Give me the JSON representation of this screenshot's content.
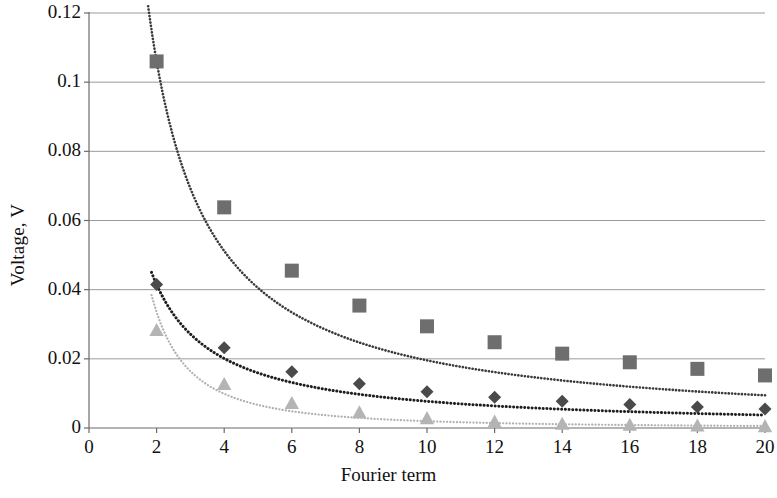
{
  "chart_data": {
    "type": "scatter",
    "title": "",
    "subtitle": "",
    "xlabel": "Fourier term",
    "ylabel": "Voltage, V",
    "xlim": [
      0,
      20
    ],
    "ylim": [
      0,
      0.12
    ],
    "xticks": [
      "0",
      "2",
      "4",
      "6",
      "8",
      "10",
      "12",
      "14",
      "16",
      "18",
      "20"
    ],
    "yticks": [
      "0",
      "0.02",
      "0.04",
      "0.06",
      "0.08",
      "0.1",
      "0.12"
    ],
    "xtick_values": [
      0,
      2,
      4,
      6,
      8,
      10,
      12,
      14,
      16,
      18,
      20
    ],
    "ytick_values": [
      0,
      0.02,
      0.04,
      0.06,
      0.08,
      0.1,
      0.12
    ],
    "grid": "horizontal",
    "legend": "none",
    "x": [
      2,
      4,
      6,
      8,
      10,
      12,
      14,
      16,
      18,
      20
    ],
    "series": [
      {
        "name": "series-squares",
        "marker": "square",
        "color": "#6e6e6e",
        "line": "dotted",
        "line_color": "#3a3a3a",
        "values": [
          0.106,
          0.0638,
          0.0455,
          0.0354,
          0.0294,
          0.0248,
          0.0215,
          0.019,
          0.0171,
          0.0152
        ]
      },
      {
        "name": "series-diamonds",
        "marker": "diamond",
        "color": "#4a4a4a",
        "line": "dotted",
        "line_color": "#1e1e1e",
        "values": [
          0.0415,
          0.0232,
          0.0163,
          0.0128,
          0.0105,
          0.0089,
          0.0077,
          0.0068,
          0.0061,
          0.0055
        ]
      },
      {
        "name": "series-triangles",
        "marker": "triangle",
        "color": "#b4b4b4",
        "line": "dotted",
        "line_color": "#b0b0b0",
        "values": [
          0.0283,
          0.0127,
          0.0072,
          0.0045,
          0.0028,
          0.0018,
          0.0012,
          0.0009,
          0.0007,
          0.0005
        ]
      }
    ],
    "trend_lines": [
      {
        "name": "trend-squares",
        "color": "#3a3a3a",
        "x_start": 1.75,
        "x_end": 20,
        "curve": "power",
        "a": 0.2195,
        "b": 1.05
      },
      {
        "name": "trend-diamonds",
        "color": "#1e1e1e",
        "x_start": 1.85,
        "x_end": 20,
        "curve": "power",
        "a": 0.0856,
        "b": 1.045
      },
      {
        "name": "trend-triangles",
        "color": "#b0b0b0",
        "x_start": 1.85,
        "x_end": 20,
        "curve": "power",
        "a": 0.1135,
        "b": 1.76
      }
    ]
  },
  "axes": {
    "y_axis_title": "Voltage, V",
    "x_axis_title": "Fourier term"
  }
}
